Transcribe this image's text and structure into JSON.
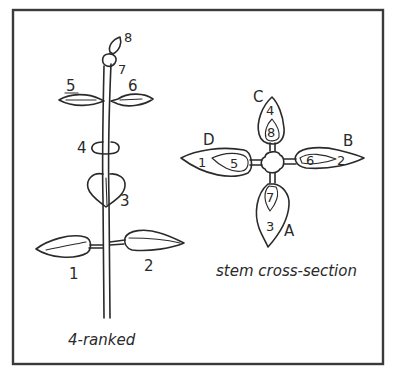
{
  "figure": {
    "type": "botanical leaf arrangement diagram",
    "frame": true
  },
  "side_view": {
    "caption": "4-ranked",
    "leaf_labels": {
      "l1": "1",
      "l2": "2",
      "l3": "3",
      "l4": "4",
      "l5": "5",
      "l6": "6",
      "l7": "7",
      "l8": "8"
    }
  },
  "cross_section": {
    "caption": "stem cross-section",
    "rank_labels": {
      "A": "A",
      "B": "B",
      "C": "C",
      "D": "D"
    },
    "leaf_labels": {
      "l1": "1",
      "l2": "2",
      "l3": "3",
      "l4": "4",
      "l5": "5",
      "l6": "6",
      "l7": "7",
      "l8": "8"
    },
    "ranks": [
      {
        "rank": "A",
        "leaves": [
          "3",
          "7"
        ],
        "direction": "down"
      },
      {
        "rank": "B",
        "leaves": [
          "2",
          "6"
        ],
        "direction": "right"
      },
      {
        "rank": "C",
        "leaves": [
          "4",
          "8"
        ],
        "direction": "up"
      },
      {
        "rank": "D",
        "leaves": [
          "1",
          "5"
        ],
        "direction": "left"
      }
    ]
  }
}
